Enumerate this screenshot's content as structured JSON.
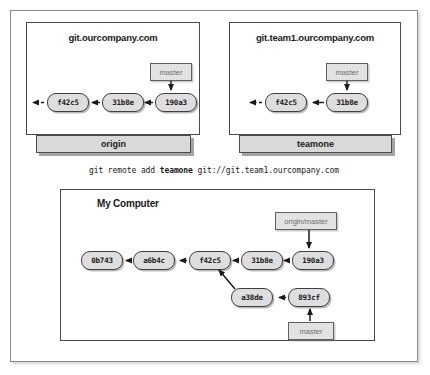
{
  "figure": {
    "caption_command_prefix": "git remote add ",
    "caption_command_remote": "teamone",
    "caption_command_suffix": " git://git.team1.ourcompany.com",
    "colors": {
      "commit_fill": "#dedede",
      "commit_border": "#3f3f3f",
      "branch_fill": "#e2e2e2",
      "branch_text": "#6d6d6d",
      "band_fill": "#d9d9d9",
      "panel_border": "#4a4a4a",
      "text": "#1a1a1a"
    }
  },
  "panels": {
    "origin": {
      "title": "git.ourcompany.com",
      "remote_name": "origin",
      "branch_label": "master",
      "commits": [
        {
          "hash": "f42c5"
        },
        {
          "hash": "31b8e"
        },
        {
          "hash": "190a3"
        }
      ]
    },
    "teamone": {
      "title": "git.team1.ourcompany.com",
      "remote_name": "teamone",
      "branch_label": "master",
      "commits": [
        {
          "hash": "f42c5"
        },
        {
          "hash": "31b8e"
        }
      ]
    },
    "mycomputer": {
      "title": "My Computer",
      "branch_label_remote": "origin/master",
      "branch_label_local": "master",
      "commits_main": [
        {
          "hash": "0b743"
        },
        {
          "hash": "a6b4c"
        },
        {
          "hash": "f42c5"
        },
        {
          "hash": "31b8e"
        },
        {
          "hash": "190a3"
        }
      ],
      "commits_branch": [
        {
          "hash": "a38de"
        },
        {
          "hash": "893cf"
        }
      ]
    }
  }
}
